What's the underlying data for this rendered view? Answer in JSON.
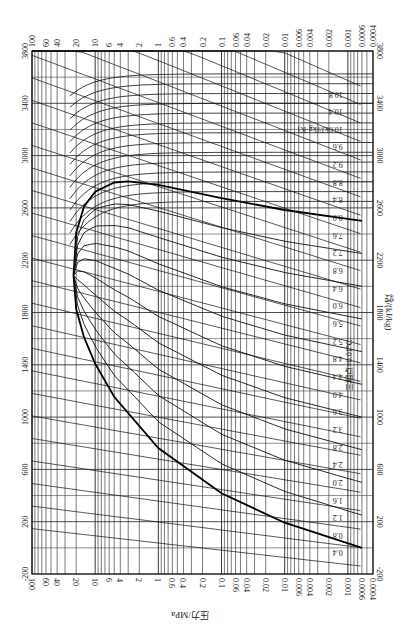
{
  "chart_data": {
    "type": "line",
    "orientation": "rotated 90 degrees: enthalpy on vertical axis, pressure (log) on horizontal axis",
    "xlabel": "压力/MPa",
    "ylabel": "焓/(kJ/kg)",
    "x_scale": "log",
    "xlim": [
      100,
      0.0004
    ],
    "ylim": [
      -200,
      3800
    ],
    "x_ticks": [
      "100",
      "60",
      "40",
      "20",
      "10",
      "6",
      "4",
      "2",
      "1",
      "0.6",
      "0.4",
      "0.2",
      "0.1",
      "0.06",
      "0.04",
      "0.02",
      "0.01",
      "0.006",
      "0.004",
      "0.002",
      "0.001",
      "0.0006",
      "0.0004"
    ],
    "y_ticks": [
      "-200",
      "200",
      "600",
      "1000",
      "1400",
      "1800",
      "2200",
      "2600",
      "3000",
      "3400",
      "3800"
    ],
    "grid": true,
    "annotations": {
      "triple_point": "三相点=0.01℃",
      "isotherm_labels_liquid": [
        "T=40℃",
        "20",
        "60",
        "80",
        "100",
        "120",
        "140",
        "160",
        "180",
        "200",
        "220",
        "240",
        "260",
        "280",
        "300",
        "320",
        "340",
        "360"
      ],
      "isotherm_labels_vapor": [
        "T=120℃",
        "140",
        "180",
        "220",
        "260",
        "300",
        "340",
        "380",
        "420",
        "480",
        "500"
      ],
      "isotherm_mid": [
        "T=100℃",
        "120",
        "140",
        "160",
        "180",
        "200",
        "220",
        "240",
        "260",
        "280",
        "300",
        "320",
        "340"
      ],
      "quality_lines_x": [
        "x=0.4",
        "0.1",
        "0.2",
        "0.3",
        "0.5",
        "0.6",
        "0.7",
        "0.8",
        "0.9"
      ],
      "entropy_lines": [
        "0.4",
        "0.8",
        "1.2",
        "1.6",
        "2.0",
        "2.4",
        "2.8",
        "3.2",
        "3.6",
        "4.0",
        "4.4",
        "4.8",
        "5.2",
        "5.6",
        "6.0",
        "6.4",
        "6.8",
        "7.2",
        "7.6",
        "8.0",
        "8.4",
        "8.8",
        "9.2",
        "9.6",
        "s=10.0kJ/(kg·K)",
        "10.4",
        "10.8"
      ],
      "density_labels": [
        "998",
        "975",
        "950",
        "900",
        "850",
        "800",
        "750",
        "700",
        "650",
        "600",
        "500",
        "400",
        "300",
        "200",
        "100",
        "80",
        "60",
        "40",
        "20",
        "10",
        "9.0",
        "8.0",
        "4.0",
        "2.0",
        "1.0",
        "0.80",
        "0.60",
        "0.40",
        "0.20",
        "0.10",
        "0.080",
        "0.060",
        "0.040",
        "0.020",
        "0.010",
        "0.008",
        "0.006",
        "0.004",
        "0.002"
      ],
      "density_unit": "ρ=50kg/m³"
    },
    "saturation_dome": {
      "critical_point": {
        "p_MPa": 22.06,
        "h_kJkg": 2084
      },
      "liquid_line": [
        [
          0.0006,
          0
        ],
        [
          0.01,
          192
        ],
        [
          0.1,
          417
        ],
        [
          1,
          763
        ],
        [
          5,
          1155
        ],
        [
          10,
          1408
        ],
        [
          15,
          1611
        ],
        [
          20,
          1827
        ],
        [
          22.06,
          2084
        ]
      ],
      "vapor_line": [
        [
          0.0006,
          2501
        ],
        [
          0.01,
          2584
        ],
        [
          0.1,
          2675
        ],
        [
          1,
          2777
        ],
        [
          3,
          2803
        ],
        [
          5,
          2794
        ],
        [
          10,
          2725
        ],
        [
          15,
          2611
        ],
        [
          20,
          2410
        ],
        [
          22.06,
          2084
        ]
      ]
    }
  },
  "axes": {
    "top_ticks": [
      "100",
      "60",
      "40",
      "20",
      "10",
      "6",
      "4",
      "2",
      "1",
      "0.6",
      "0.4",
      "0.2",
      "0.1",
      "0.06",
      "0.04",
      "0.02",
      "0.01",
      "0.006",
      "0.004",
      "0.002",
      "0.001",
      "0.0006",
      "0.0004"
    ],
    "bottom_ticks": [
      "100",
      "60",
      "40",
      "20",
      "10",
      "6",
      "4",
      "2",
      "1",
      "0.6",
      "0.4",
      "0.2",
      "0.1",
      "0.06",
      "0.04",
      "0.02",
      "0.01",
      "0.006",
      "0.004",
      "0.002",
      "0.001",
      "0.0006",
      "0.0004"
    ],
    "left_ticks": [
      "-200",
      "200",
      "600",
      "1000",
      "1400",
      "1800",
      "2200",
      "2600",
      "3000",
      "3400",
      "3800"
    ],
    "right_ticks": [
      "-200",
      "200",
      "600",
      "1000",
      "1400",
      "1800",
      "2200",
      "2600",
      "3000",
      "3400",
      "3800"
    ],
    "bottom_title": "压力/MPa",
    "right_title": "焓/(kJ/kg)",
    "triple_point_label": "三相点=0.01℃"
  }
}
